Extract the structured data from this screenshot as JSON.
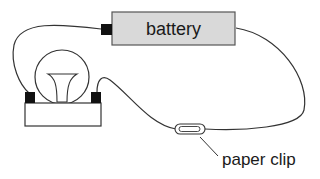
{
  "diagram": {
    "type": "simple electric circuit",
    "components": {
      "battery": {
        "label": "battery",
        "fill": "#d9d9d9"
      },
      "bulb": {
        "label": ""
      },
      "paper_clip": {
        "label": "paper clip"
      }
    },
    "colors": {
      "wire": "#333333",
      "terminal": "#111111",
      "battery_fill": "#d9d9d9",
      "background": "#ffffff"
    }
  }
}
